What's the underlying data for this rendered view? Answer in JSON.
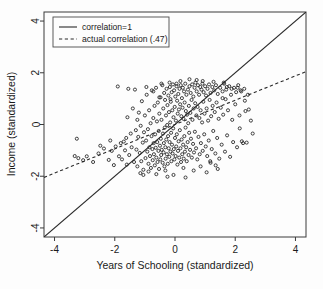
{
  "chart_data": {
    "type": "scatter",
    "title": "",
    "xlabel": "Years of Schooling (standardized)",
    "ylabel": "Income (standardized)",
    "xlim": [
      -4.35,
      4.35
    ],
    "ylim": [
      -4.35,
      4.35
    ],
    "xticks": [
      -4,
      -2,
      0,
      2,
      4
    ],
    "yticks": [
      -4,
      -2,
      0,
      2,
      4
    ],
    "xticklabels": [
      "-4",
      "-2",
      "0",
      "2",
      "4"
    ],
    "yticklabels": [
      "-4",
      "-2",
      "0",
      "2",
      "4"
    ],
    "grid": false,
    "legend_position": "upper-left",
    "legend": [
      {
        "label": "correlation=1",
        "style": "solid"
      },
      {
        "label": "actual correlation (.47)",
        "style": "dashed"
      }
    ],
    "reference_lines": [
      {
        "name": "identity",
        "style": "solid",
        "slope": 1,
        "intercept": 0,
        "label": "correlation=1"
      },
      {
        "name": "regression",
        "style": "dashed",
        "slope": 0.47,
        "intercept": 0,
        "label": "actual correlation (.47)"
      }
    ],
    "marker": {
      "shape": "open-circle",
      "size": 3.1,
      "edge_color": "#222222",
      "fill": "none"
    },
    "n_points": 300,
    "correlation": 0.47,
    "points": [
      [
        -3.26,
        -0.55
      ],
      [
        -3.33,
        -1.22
      ],
      [
        -3.21,
        -1.3
      ],
      [
        -2.93,
        -1.23
      ],
      [
        -2.54,
        -1.12
      ],
      [
        -2.48,
        -0.82
      ],
      [
        -2.36,
        -0.93
      ],
      [
        -2.2,
        -1.37
      ],
      [
        -2.1,
        -1.02
      ],
      [
        -2.03,
        -1.57
      ],
      [
        -1.97,
        -0.85
      ],
      [
        -1.9,
        1.47
      ],
      [
        -1.86,
        -1.23
      ],
      [
        -1.8,
        -0.72
      ],
      [
        -1.76,
        -1.35
      ],
      [
        -1.7,
        -0.66
      ],
      [
        -1.66,
        -1.0
      ],
      [
        -1.6,
        -1.55
      ],
      [
        -1.58,
        0.28
      ],
      [
        -1.52,
        -1.18
      ],
      [
        -1.47,
        -0.35
      ],
      [
        -1.44,
        -0.88
      ],
      [
        -1.4,
        0.62
      ],
      [
        -1.36,
        -1.45
      ],
      [
        -1.33,
        1.35
      ],
      [
        -1.3,
        -0.22
      ],
      [
        -1.28,
        -0.97
      ],
      [
        -1.25,
        -1.62
      ],
      [
        -1.22,
        -0.48
      ],
      [
        -1.2,
        0.46
      ],
      [
        -1.17,
        -1.1
      ],
      [
        -1.14,
        -0.05
      ],
      [
        -1.12,
        -1.42
      ],
      [
        -1.1,
        0.9
      ],
      [
        -1.07,
        -0.7
      ],
      [
        -1.05,
        -1.75
      ],
      [
        -1.03,
        -0.3
      ],
      [
        -1.0,
        0.35
      ],
      [
        -0.98,
        -1.3
      ],
      [
        -0.96,
        -0.62
      ],
      [
        -0.94,
        1.15
      ],
      [
        -0.92,
        -1.05
      ],
      [
        -0.9,
        -0.18
      ],
      [
        -0.88,
        -1.52
      ],
      [
        -0.86,
        0.55
      ],
      [
        -0.85,
        -0.88
      ],
      [
        -0.83,
        -1.22
      ],
      [
        -0.81,
        0.05
      ],
      [
        -0.8,
        -1.68
      ],
      [
        -0.78,
        -0.45
      ],
      [
        -0.77,
        1.32
      ],
      [
        -0.75,
        -0.95
      ],
      [
        -0.74,
        -1.38
      ],
      [
        -0.72,
        0.25
      ],
      [
        -0.71,
        -0.72
      ],
      [
        -0.7,
        -1.15
      ],
      [
        -0.68,
        0.72
      ],
      [
        -0.67,
        -1.58
      ],
      [
        -0.66,
        -0.38
      ],
      [
        -0.64,
        -0.9
      ],
      [
        -0.63,
        1.42
      ],
      [
        -0.62,
        -1.28
      ],
      [
        -0.6,
        0.12
      ],
      [
        -0.59,
        -0.68
      ],
      [
        -0.58,
        -1.45
      ],
      [
        -0.57,
        0.85
      ],
      [
        -0.55,
        -1.02
      ],
      [
        -0.54,
        -0.25
      ],
      [
        -0.53,
        -1.72
      ],
      [
        -0.52,
        0.42
      ],
      [
        -0.5,
        -0.82
      ],
      [
        -0.49,
        -1.35
      ],
      [
        -0.48,
        1.05
      ],
      [
        -0.47,
        -0.55
      ],
      [
        -0.46,
        -1.18
      ],
      [
        -0.45,
        0.18
      ],
      [
        -0.44,
        -0.98
      ],
      [
        -0.42,
        1.52
      ],
      [
        -0.41,
        -1.48
      ],
      [
        -0.4,
        -0.35
      ],
      [
        -0.39,
        0.62
      ],
      [
        -0.38,
        -1.08
      ],
      [
        -0.37,
        -0.72
      ],
      [
        -0.36,
        1.22
      ],
      [
        -0.35,
        -1.62
      ],
      [
        -0.34,
        -0.12
      ],
      [
        -0.33,
        0.95
      ],
      [
        -0.32,
        -0.88
      ],
      [
        -0.31,
        -1.32
      ],
      [
        -0.3,
        0.35
      ],
      [
        -0.29,
        -0.58
      ],
      [
        -0.28,
        1.38
      ],
      [
        -0.27,
        -1.15
      ],
      [
        -0.26,
        -0.02
      ],
      [
        -0.25,
        0.75
      ],
      [
        -0.24,
        -1.52
      ],
      [
        -0.23,
        -0.45
      ],
      [
        -0.22,
        1.12
      ],
      [
        -0.21,
        -0.92
      ],
      [
        -0.2,
        0.48
      ],
      [
        -0.19,
        -1.25
      ],
      [
        -0.18,
        -0.68
      ],
      [
        -0.17,
        1.45
      ],
      [
        -0.16,
        0.08
      ],
      [
        -0.15,
        -1.05
      ],
      [
        -0.14,
        0.88
      ],
      [
        -0.13,
        -0.32
      ],
      [
        -0.12,
        -1.42
      ],
      [
        -0.11,
        1.25
      ],
      [
        -0.1,
        -0.78
      ],
      [
        -0.09,
        0.55
      ],
      [
        -0.08,
        -1.12
      ],
      [
        -0.07,
        1.55
      ],
      [
        -0.06,
        -0.15
      ],
      [
        -0.05,
        0.28
      ],
      [
        -0.04,
        -0.95
      ],
      [
        -0.03,
        1.32
      ],
      [
        -0.02,
        -1.35
      ],
      [
        -0.01,
        0.68
      ],
      [
        0.0,
        -0.52
      ],
      [
        0.01,
        1.08
      ],
      [
        0.02,
        -1.22
      ],
      [
        0.03,
        0.15
      ],
      [
        0.04,
        -0.85
      ],
      [
        0.05,
        1.48
      ],
      [
        0.06,
        -0.38
      ],
      [
        0.07,
        0.92
      ],
      [
        0.08,
        -1.55
      ],
      [
        0.09,
        0.42
      ],
      [
        0.1,
        -1.02
      ],
      [
        0.11,
        1.18
      ],
      [
        0.12,
        -0.65
      ],
      [
        0.13,
        0.58
      ],
      [
        0.14,
        -1.28
      ],
      [
        0.15,
        1.38
      ],
      [
        0.16,
        -0.22
      ],
      [
        0.17,
        0.78
      ],
      [
        0.18,
        -0.92
      ],
      [
        0.19,
        1.52
      ],
      [
        0.2,
        -1.45
      ],
      [
        0.21,
        0.32
      ],
      [
        0.22,
        -0.58
      ],
      [
        0.23,
        1.02
      ],
      [
        0.24,
        -1.15
      ],
      [
        0.25,
        0.65
      ],
      [
        0.26,
        1.42
      ],
      [
        0.27,
        -0.78
      ],
      [
        0.28,
        0.22
      ],
      [
        0.29,
        -1.32
      ],
      [
        0.3,
        1.28
      ],
      [
        0.31,
        -0.45
      ],
      [
        0.32,
        0.85
      ],
      [
        0.33,
        -1.05
      ],
      [
        0.34,
        1.58
      ],
      [
        0.35,
        -0.12
      ],
      [
        0.36,
        0.52
      ],
      [
        0.37,
        -0.88
      ],
      [
        0.38,
        1.15
      ],
      [
        0.39,
        -1.42
      ],
      [
        0.4,
        0.38
      ],
      [
        0.42,
        -0.68
      ],
      [
        0.43,
        1.35
      ],
      [
        0.44,
        0.05
      ],
      [
        0.45,
        -1.18
      ],
      [
        0.46,
        0.72
      ],
      [
        0.47,
        -0.32
      ],
      [
        0.48,
        1.48
      ],
      [
        0.5,
        -0.98
      ],
      [
        0.51,
        0.45
      ],
      [
        0.52,
        1.22
      ],
      [
        0.53,
        -0.55
      ],
      [
        0.55,
        0.95
      ],
      [
        0.56,
        -1.28
      ],
      [
        0.57,
        1.55
      ],
      [
        0.58,
        0.18
      ],
      [
        0.6,
        -0.75
      ],
      [
        0.61,
        1.08
      ],
      [
        0.62,
        0.62
      ],
      [
        0.63,
        -1.08
      ],
      [
        0.65,
        1.42
      ],
      [
        0.66,
        -0.28
      ],
      [
        0.67,
        0.82
      ],
      [
        0.68,
        1.62
      ],
      [
        0.7,
        -0.92
      ],
      [
        0.71,
        0.35
      ],
      [
        0.72,
        1.28
      ],
      [
        0.74,
        -1.35
      ],
      [
        0.75,
        0.68
      ],
      [
        0.76,
        1.52
      ],
      [
        0.78,
        -0.48
      ],
      [
        0.8,
        1.15
      ],
      [
        0.81,
        0.25
      ],
      [
        0.82,
        -1.15
      ],
      [
        0.84,
        1.45
      ],
      [
        0.85,
        0.55
      ],
      [
        0.86,
        -0.72
      ],
      [
        0.88,
        1.35
      ],
      [
        0.9,
        0.08
      ],
      [
        0.91,
        1.58
      ],
      [
        0.92,
        -1.02
      ],
      [
        0.94,
        0.88
      ],
      [
        0.95,
        1.25
      ],
      [
        0.97,
        -0.38
      ],
      [
        0.98,
        0.42
      ],
      [
        1.0,
        1.48
      ],
      [
        1.02,
        -0.85
      ],
      [
        1.03,
        1.12
      ],
      [
        1.05,
        0.62
      ],
      [
        1.07,
        -1.22
      ],
      [
        1.08,
        1.38
      ],
      [
        1.1,
        0.15
      ],
      [
        1.12,
        -0.62
      ],
      [
        1.13,
        1.55
      ],
      [
        1.15,
        0.95
      ],
      [
        1.17,
        -1.42
      ],
      [
        1.18,
        1.22
      ],
      [
        1.2,
        0.32
      ],
      [
        1.22,
        -0.95
      ],
      [
        1.24,
        1.45
      ],
      [
        1.25,
        0.72
      ],
      [
        1.27,
        -0.25
      ],
      [
        1.3,
        1.32
      ],
      [
        1.32,
        0.48
      ],
      [
        1.34,
        -1.12
      ],
      [
        1.36,
        1.52
      ],
      [
        1.38,
        0.85
      ],
      [
        1.4,
        -0.52
      ],
      [
        1.42,
        1.18
      ],
      [
        1.45,
        0.22
      ],
      [
        1.47,
        -1.32
      ],
      [
        1.5,
        1.42
      ],
      [
        1.52,
        0.65
      ],
      [
        1.55,
        -0.78
      ],
      [
        1.58,
        1.28
      ],
      [
        1.6,
        0.38
      ],
      [
        1.63,
        1.58
      ],
      [
        1.66,
        -1.05
      ],
      [
        1.68,
        0.98
      ],
      [
        1.7,
        1.35
      ],
      [
        1.73,
        -0.42
      ],
      [
        1.76,
        0.55
      ],
      [
        1.8,
        1.48
      ],
      [
        1.83,
        -1.25
      ],
      [
        1.86,
        1.15
      ],
      [
        1.9,
        0.18
      ],
      [
        1.93,
        -0.68
      ],
      [
        1.96,
        1.42
      ],
      [
        2.0,
        0.78
      ],
      [
        2.03,
        1.25
      ],
      [
        2.06,
        -0.88
      ],
      [
        2.1,
        1.52
      ],
      [
        2.14,
        0.35
      ],
      [
        2.18,
        1.32
      ],
      [
        2.22,
        -0.65
      ],
      [
        2.26,
        -0.72
      ],
      [
        2.3,
        1.38
      ],
      [
        2.34,
        0.52
      ],
      [
        2.38,
        -0.7
      ],
      [
        2.45,
        0.58
      ],
      [
        -0.62,
        -1.92
      ],
      [
        -0.25,
        -2.02
      ],
      [
        0.35,
        -2.05
      ],
      [
        1.05,
        -1.85
      ],
      [
        -1.15,
        -1.88
      ],
      [
        0.62,
        -1.78
      ],
      [
        1.42,
        -1.72
      ],
      [
        -0.05,
        -1.95
      ],
      [
        0.85,
        -1.62
      ],
      [
        -0.88,
        -1.82
      ],
      [
        2.52,
        0.15
      ],
      [
        2.58,
        -0.35
      ],
      [
        -2.72,
        -1.45
      ],
      [
        -3.05,
        -1.38
      ],
      [
        0.18,
        1.68
      ],
      [
        0.72,
        1.72
      ],
      [
        -0.18,
        1.62
      ],
      [
        1.28,
        1.65
      ],
      [
        0.48,
        1.75
      ],
      [
        -0.45,
        1.58
      ],
      [
        1.62,
        1.62
      ],
      [
        2.08,
        1.42
      ],
      [
        -0.95,
        1.45
      ],
      [
        0.05,
        1.58
      ],
      [
        1.88,
        1.38
      ],
      [
        -0.72,
        1.28
      ],
      [
        2.2,
        1.28
      ],
      [
        0.92,
        1.68
      ],
      [
        1.72,
        1.45
      ],
      [
        -1.55,
        1.38
      ],
      [
        -0.32,
        -1.78
      ],
      [
        1.18,
        -1.48
      ],
      [
        2.32,
        0.92
      ],
      [
        -2.15,
        -0.62
      ],
      [
        -1.25,
        0.18
      ],
      [
        -1.62,
        -0.52
      ],
      [
        2.42,
        1.15
      ],
      [
        0.28,
        -1.68
      ],
      [
        -0.52,
        1.05
      ],
      [
        1.35,
        -1.58
      ],
      [
        -1.05,
        -1.95
      ],
      [
        1.58,
        1.02
      ],
      [
        -0.15,
        0.98
      ],
      [
        2.15,
        -0.15
      ]
    ]
  }
}
